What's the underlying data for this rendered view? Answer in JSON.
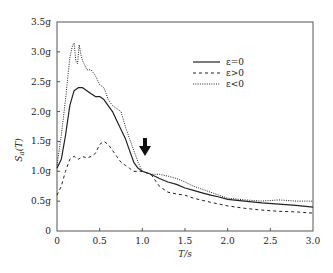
{
  "chart_data": {
    "type": "line",
    "title": "",
    "xlabel": "T/s",
    "ylabel": "Sa(T)",
    "xlim": [
      0,
      3.0
    ],
    "ylim": [
      0,
      3.5
    ],
    "x_ticks": [
      "0",
      "0.5",
      "1.0",
      "1.5",
      "2.0",
      "2.5",
      "3.0"
    ],
    "y_ticks": [
      "0",
      "0.5g",
      "1.0g",
      "1.5g",
      "2.0g",
      "2.5g",
      "3.0g",
      "3.5g"
    ],
    "grid": false,
    "legend_position": "upper right",
    "annotations": [
      {
        "type": "arrow-down",
        "x": 1.03,
        "y_from": 1.55,
        "y_to": 1.25
      }
    ],
    "series": [
      {
        "name": "ε=0",
        "style": "solid",
        "x": [
          0,
          0.05,
          0.1,
          0.15,
          0.2,
          0.25,
          0.3,
          0.35,
          0.4,
          0.45,
          0.5,
          0.55,
          0.6,
          0.65,
          0.7,
          0.75,
          0.8,
          0.85,
          0.9,
          0.95,
          1.0,
          1.1,
          1.2,
          1.3,
          1.4,
          1.5,
          1.6,
          1.7,
          1.8,
          1.9,
          2.0,
          2.2,
          2.4,
          2.6,
          2.8,
          3.0
        ],
        "values": [
          1.05,
          1.2,
          1.6,
          2.1,
          2.35,
          2.4,
          2.4,
          2.35,
          2.3,
          2.25,
          2.25,
          2.2,
          2.1,
          2.0,
          1.85,
          1.7,
          1.55,
          1.35,
          1.15,
          1.05,
          1.0,
          0.95,
          0.88,
          0.82,
          0.78,
          0.72,
          0.68,
          0.64,
          0.6,
          0.57,
          0.53,
          0.5,
          0.47,
          0.45,
          0.43,
          0.4
        ]
      },
      {
        "name": "ε>0",
        "style": "dashed",
        "x": [
          0,
          0.05,
          0.1,
          0.15,
          0.2,
          0.25,
          0.3,
          0.35,
          0.4,
          0.45,
          0.5,
          0.55,
          0.6,
          0.65,
          0.7,
          0.75,
          0.8,
          0.85,
          0.9,
          0.95,
          1.0,
          1.1,
          1.2,
          1.3,
          1.4,
          1.5,
          1.6,
          1.8,
          2.0,
          2.2,
          2.4,
          2.6,
          2.8,
          3.0
        ],
        "values": [
          0.6,
          0.75,
          1.0,
          1.2,
          1.25,
          1.2,
          1.25,
          1.22,
          1.25,
          1.3,
          1.45,
          1.5,
          1.45,
          1.35,
          1.25,
          1.15,
          1.1,
          1.05,
          1.0,
          1.0,
          1.0,
          0.95,
          0.75,
          0.65,
          0.62,
          0.6,
          0.55,
          0.48,
          0.42,
          0.38,
          0.35,
          0.33,
          0.32,
          0.3
        ]
      },
      {
        "name": "ε<0",
        "style": "dotted",
        "x": [
          0,
          0.05,
          0.1,
          0.15,
          0.18,
          0.2,
          0.22,
          0.24,
          0.26,
          0.28,
          0.3,
          0.35,
          0.4,
          0.45,
          0.5,
          0.55,
          0.6,
          0.65,
          0.7,
          0.75,
          0.8,
          0.85,
          0.9,
          0.95,
          1.0,
          1.1,
          1.2,
          1.3,
          1.4,
          1.5,
          1.6,
          1.8,
          2.0,
          2.2,
          2.4,
          2.6,
          2.8,
          3.0
        ],
        "values": [
          1.1,
          1.6,
          2.2,
          2.9,
          3.1,
          3.15,
          2.85,
          2.8,
          3.12,
          2.95,
          2.85,
          2.7,
          2.7,
          2.6,
          2.45,
          2.4,
          2.2,
          2.1,
          2.05,
          2.0,
          1.75,
          1.55,
          1.35,
          1.15,
          1.0,
          0.95,
          0.95,
          0.92,
          0.88,
          0.82,
          0.75,
          0.65,
          0.55,
          0.52,
          0.5,
          0.52,
          0.5,
          0.5
        ]
      }
    ]
  },
  "legend": {
    "items": [
      {
        "label": "ε=0",
        "style": "solid"
      },
      {
        "label": "ε>0",
        "style": "dashed"
      },
      {
        "label": "ε<0",
        "style": "dotted"
      }
    ]
  },
  "axes": {
    "xlabel": "T/s",
    "ylabel_main": "S",
    "ylabel_sub": "a",
    "ylabel_tail": "(T)"
  },
  "colors": {
    "line": "#222222",
    "frame": "#555555",
    "arrow": "#111111"
  }
}
